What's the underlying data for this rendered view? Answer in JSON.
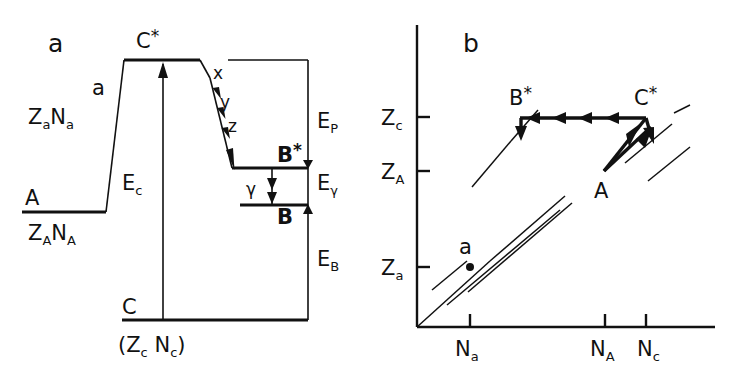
{
  "figure": {
    "background": "#ffffff",
    "ink_color": "#111111",
    "width": 735,
    "height": 378
  },
  "panel_a": {
    "panel_label": "a",
    "caption_type": "energy-level-diagram",
    "levels": [
      {
        "name": "A",
        "label": "A",
        "sublabel": "ZₐNₐ (capital A subscripts)"
      },
      {
        "name": "Cstar",
        "label": "C",
        "superscript": "*"
      },
      {
        "name": "Bstar",
        "label": "B",
        "superscript": "*"
      },
      {
        "name": "B",
        "label": "B"
      },
      {
        "name": "C",
        "label": "C",
        "sublabel": "(Z꜀ N꜀)"
      }
    ],
    "labels": {
      "entrance_particle": "a",
      "entrance_coords_Z": "Z",
      "entrance_coords_Z_sub": "a",
      "entrance_coords_N": "N",
      "entrance_coords_N_sub": "a",
      "ground_coords_Z": "Z",
      "ground_coords_Z_sub": "A",
      "ground_coords_N": "N",
      "ground_coords_N_sub": "A",
      "compound_Z": "Z",
      "compound_Z_sub": "c",
      "compound_N": "N",
      "compound_N_sub": "c",
      "paren_open": "(",
      "paren_close": ")",
      "level_A": "A",
      "level_C": "C",
      "level_B": "B",
      "level_Bstar": "B",
      "level_Cstar": "C",
      "star": "*"
    },
    "energies": [
      {
        "name": "E_c",
        "symbol": "E",
        "subscript": "c"
      },
      {
        "name": "E_P",
        "symbol": "E",
        "subscript": "P"
      },
      {
        "name": "E_gamma",
        "symbol": "E",
        "subscript": "γ"
      },
      {
        "name": "E_B",
        "symbol": "E",
        "subscript": "B"
      }
    ],
    "cascade": {
      "description": "particle evaporation cascade from C* to B*",
      "steps": [
        "x",
        "y",
        "z"
      ],
      "arrowhead_count": 4
    },
    "gamma_transition": {
      "symbol": "γ",
      "arrowheads": 2
    }
  },
  "panel_b": {
    "panel_label": "b",
    "caption_type": "Z-versus-N trajectory plot",
    "axes": {
      "x_ticks": [
        {
          "symbol": "N",
          "subscript": "a"
        },
        {
          "symbol": "N",
          "subscript": "A"
        },
        {
          "symbol": "N",
          "subscript": "c"
        }
      ],
      "y_ticks": [
        {
          "symbol": "Z",
          "subscript": "c"
        },
        {
          "symbol": "Z",
          "subscript": "A"
        },
        {
          "symbol": "Z",
          "subscript": "a"
        }
      ]
    },
    "points": [
      {
        "name": "a",
        "label": "a",
        "marker": "filled-dot"
      },
      {
        "name": "A",
        "label": "A",
        "marker": "vertex"
      },
      {
        "name": "Cstar",
        "label": "C",
        "superscript": "*"
      },
      {
        "name": "Bstar",
        "label": "B",
        "superscript": "*"
      }
    ],
    "paths": [
      {
        "name": "A-to-Cstar",
        "style": "bold-double-arrow"
      },
      {
        "name": "Cstar-to-Bstar",
        "style": "bold-horizontal",
        "arrowheads": 4,
        "direction": "leftward"
      },
      {
        "name": "Cstar-down",
        "style": "bold-down-arrow"
      },
      {
        "name": "Bstar-down",
        "style": "bold-down-arrow"
      }
    ],
    "valley_lines": {
      "name": "stability-valley-guides",
      "count": 6,
      "style": "thin-diagonal-segments"
    }
  }
}
